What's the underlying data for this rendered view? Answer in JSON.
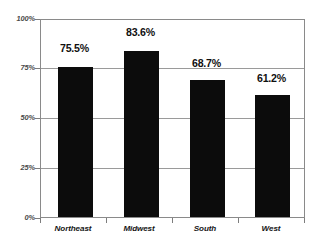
{
  "chart_data": {
    "type": "bar",
    "title": "",
    "subtitle": "",
    "xlabel": "",
    "ylabel": "",
    "categories": [
      "Northeast",
      "Midwest",
      "South",
      "West"
    ],
    "values": [
      75.5,
      83.6,
      68.7,
      61.2
    ],
    "value_labels": [
      "75.5%",
      "83.6%",
      "68.7%",
      "61.2%"
    ],
    "ylim": [
      0,
      100
    ],
    "ytick_values": [
      100,
      75,
      50,
      25,
      0
    ],
    "ytick_labels": [
      "100%",
      "75%",
      "50%",
      "25%",
      "0%"
    ],
    "grid": true,
    "legend": false,
    "series": [
      {
        "name": "",
        "values": [
          75.5,
          83.6,
          68.7,
          61.2
        ]
      }
    ],
    "bar_color": "#0c0c0c",
    "grid_color": "#9a9a9a",
    "frame_color": "#8a8a8a",
    "background_color": "#ffffff"
  }
}
